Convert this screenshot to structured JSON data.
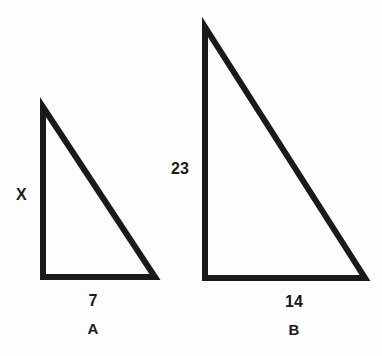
{
  "figure": {
    "background_color": "#fdfdfd",
    "stroke_color": "#1a1a1a",
    "stroke_width": 6
  },
  "triangles": [
    {
      "name": "A",
      "name_label": "A",
      "vertical_side_label": "X",
      "base_label": "7",
      "geometry": {
        "apex": [
          43,
          107
        ],
        "bottom_left": [
          43,
          277
        ],
        "bottom_right": [
          155,
          277
        ]
      }
    },
    {
      "name": "B",
      "name_label": "B",
      "vertical_side_label": "23",
      "base_label": "14",
      "geometry": {
        "apex": [
          205,
          27
        ],
        "bottom_left": [
          205,
          278
        ],
        "bottom_right": [
          365,
          278
        ]
      }
    }
  ],
  "chart_data": {
    "type": "diagram",
    "shapes": [
      {
        "label": "A",
        "kind": "right-triangle",
        "vertical_leg": "X",
        "horizontal_leg": "7"
      },
      {
        "label": "B",
        "kind": "right-triangle",
        "vertical_leg": "23",
        "horizontal_leg": "14"
      }
    ]
  }
}
